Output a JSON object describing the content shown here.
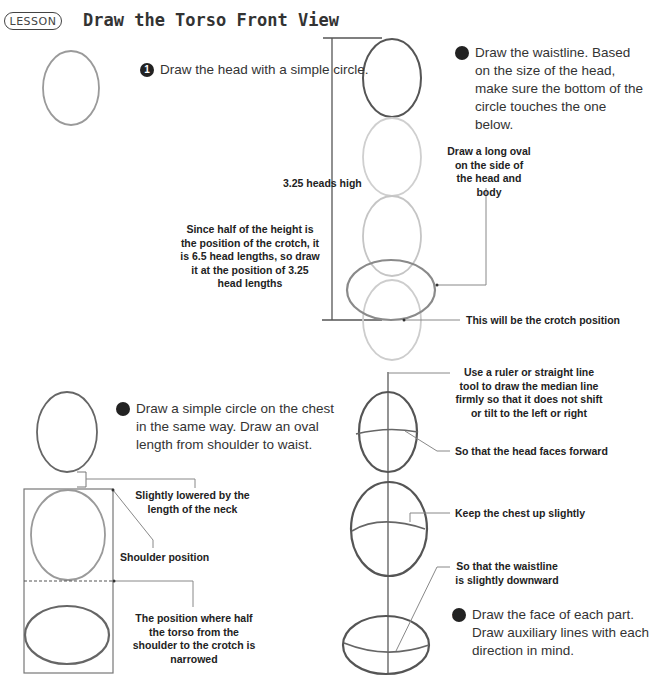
{
  "header": {
    "badge": "LESSON",
    "title": "Draw the Torso Front View"
  },
  "steps": [
    {
      "num": "1",
      "text": "Draw the head with a simple circle."
    },
    {
      "num": "2",
      "text": "Draw the waistline. Based on the size of the head, make sure the bottom of the circle touches the one below."
    },
    {
      "num": "3",
      "text": "Draw a simple circle on the chest in the same way. Draw an oval length from shoulder to waist."
    },
    {
      "num": "4",
      "text": "Draw the face of each part. Draw auxiliary lines with each direction in mind."
    }
  ],
  "annotations": {
    "heads_high": "3.25 heads high",
    "long_oval": "Draw a long oval on the side of the head and body",
    "half_height": "Since half of the height is the position of the crotch, it is 6.5 head lengths, so draw it at the position of 3.25 head lengths",
    "crotch_position": "This will be the crotch position",
    "neck_lowered": "Slightly lowered by the length of the neck",
    "shoulder_position": "Shoulder position",
    "torso_half": "The position where half the torso from the shoulder to the crotch is narrowed",
    "median_line": "Use a ruler or straight line tool to draw the median line firmly so that it does not shift or tilt to the left or right",
    "head_forward": "So that the head faces forward",
    "chest_up": "Keep the chest up slightly",
    "waist_down": "So that the waistline is slightly downward"
  },
  "colors": {
    "dark_stroke": "#555555",
    "light_stroke": "#c8c8c8",
    "text": "#222222"
  }
}
